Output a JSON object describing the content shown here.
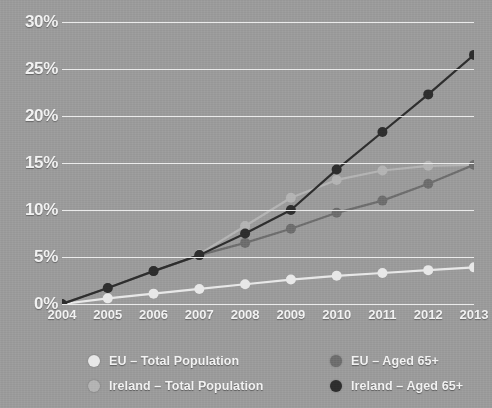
{
  "chart_data": {
    "type": "line",
    "title": "",
    "subtitle": "",
    "xlabel": "",
    "ylabel": "",
    "x": [
      "2004",
      "2005",
      "2006",
      "2007",
      "2008",
      "2009",
      "2010",
      "2011",
      "2012",
      "2013"
    ],
    "categories": [
      "2004",
      "2005",
      "2006",
      "2007",
      "2008",
      "2009",
      "2010",
      "2011",
      "2012",
      "2013"
    ],
    "ylim": [
      0,
      30
    ],
    "ytick_labels": [
      "0%",
      "5%",
      "10%",
      "15%",
      "20%",
      "25%",
      "30%"
    ],
    "ytick_values": [
      0,
      5,
      10,
      15,
      20,
      25,
      30
    ],
    "grid": true,
    "legend_position": "bottom",
    "markers": "circle",
    "background_color": "#9b9b9b",
    "gridline_color": "#ebebeb",
    "text_color": "#f2f2f2",
    "series": [
      {
        "name": "EU – Total Population",
        "color": "#e8e8e8",
        "values": [
          0,
          0.6,
          1.1,
          1.6,
          2.1,
          2.6,
          3.0,
          3.3,
          3.6,
          3.9
        ]
      },
      {
        "name": "Ireland – Total Population",
        "color": "#b4b4b4",
        "values": [
          0,
          1.7,
          3.5,
          5.3,
          8.3,
          11.3,
          13.2,
          14.2,
          14.7,
          14.8
        ]
      },
      {
        "name": "EU – Aged 65+",
        "color": "#6e6e6e",
        "values": [
          0,
          1.7,
          3.5,
          5.2,
          6.5,
          8.0,
          9.7,
          11.0,
          12.8,
          14.8
        ]
      },
      {
        "name": "Ireland – Aged 65+",
        "color": "#2e2e2e",
        "values": [
          0,
          1.7,
          3.5,
          5.2,
          7.5,
          10.0,
          14.3,
          18.3,
          22.3,
          26.5
        ]
      }
    ]
  },
  "legend": {
    "columns": [
      {
        "items": [
          0,
          1
        ]
      },
      {
        "items": [
          2,
          3
        ]
      }
    ]
  }
}
